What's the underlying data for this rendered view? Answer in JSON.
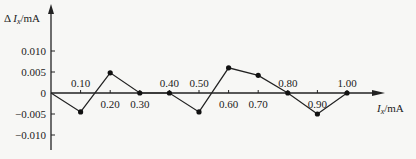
{
  "chart_data": {
    "type": "line",
    "title": "",
    "ylabel": "ΔI_x/mA",
    "xlabel": "I_x/mA",
    "x": [
      0,
      0.1,
      0.2,
      0.3,
      0.4,
      0.5,
      0.6,
      0.7,
      0.8,
      0.9,
      1.0
    ],
    "values": [
      0,
      -0.0045,
      0.0048,
      0,
      0,
      -0.0045,
      0.006,
      0.0042,
      0,
      -0.005,
      0
    ],
    "x_tick_labels": [
      "0.10",
      "0.20",
      "0.30",
      "0.40",
      "0.50",
      "0.60",
      "0.70",
      "0.80",
      "0.90",
      "1.00"
    ],
    "y_ticks": [
      0.01,
      0.005,
      0,
      -0.005,
      -0.01
    ],
    "y_tick_labels": [
      "0.010",
      "0.005",
      "0",
      "-0.005",
      "-0.010"
    ],
    "ylim": [
      -0.012,
      0.018
    ],
    "xlim": [
      0,
      1.1
    ],
    "grid": false,
    "legend": null
  },
  "labels": {
    "y_axis_main": "Δ I",
    "y_axis_sub": "x",
    "y_axis_unit": "/mA",
    "x_axis_main": "I",
    "x_axis_sub": "x",
    "x_axis_unit": "/mA"
  }
}
